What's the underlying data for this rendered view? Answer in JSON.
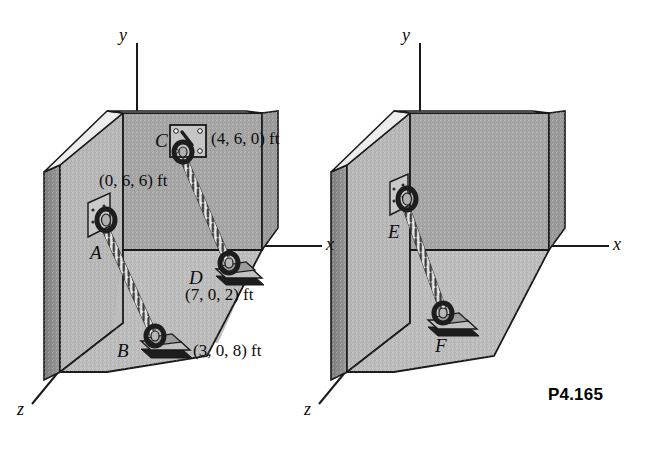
{
  "figure": {
    "caption": "P4.165",
    "units": "ft"
  },
  "diagrams": [
    {
      "id": "left-diagram",
      "name": "labeled-room-diagram",
      "axes": [
        {
          "name": "y-axis",
          "label": "y"
        },
        {
          "name": "x-axis",
          "label": "x"
        },
        {
          "name": "z-axis",
          "label": "z"
        }
      ],
      "points": [
        {
          "id": "A",
          "label": "A",
          "coord_label": "(0, 6, 6) ft",
          "mount": "wall-bracket"
        },
        {
          "id": "B",
          "label": "B",
          "coord_label": "(3, 0, 8) ft",
          "mount": "floor-bracket"
        },
        {
          "id": "C",
          "label": "C",
          "coord_label": "(4, 6, 0) ft",
          "mount": "wall-plate-bracket"
        },
        {
          "id": "D",
          "label": "D",
          "coord_label": "(7, 0, 2) ft",
          "mount": "floor-bracket"
        }
      ],
      "cables": [
        {
          "id": "AB",
          "from": "A",
          "to": "B"
        },
        {
          "id": "CD",
          "from": "C",
          "to": "D"
        }
      ]
    },
    {
      "id": "right-diagram",
      "name": "unlabeled-room-diagram",
      "axes": [
        {
          "name": "y-axis",
          "label": "y"
        },
        {
          "name": "x-axis",
          "label": "x"
        },
        {
          "name": "z-axis",
          "label": "z"
        }
      ],
      "points": [
        {
          "id": "E",
          "label": "E",
          "coord_label": "",
          "mount": "wall-bracket"
        },
        {
          "id": "F",
          "label": "F",
          "coord_label": "",
          "mount": "floor-bracket"
        }
      ],
      "cables": [
        {
          "id": "EF",
          "from": "E",
          "to": "F"
        }
      ]
    }
  ],
  "colors": {
    "back_wall": "#a8a8a8",
    "side_wall": "#b8b8b8",
    "floor": "#bcbcbc",
    "wall_top": "#e3e3e3",
    "wall_edge_dark": "#8a8a8a",
    "outline": "#1a1a1a",
    "cable_light": "#f0f0f0",
    "cable_dark": "#4a4a4a",
    "text": "#0d0d0d"
  }
}
